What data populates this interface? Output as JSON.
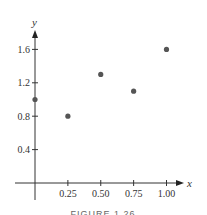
{
  "chart_data": {
    "type": "scatter",
    "title": "",
    "caption": "FIGURE 1.26",
    "xlabel": "x",
    "ylabel": "y",
    "xlim": [
      0,
      1.1
    ],
    "ylim": [
      0,
      1.8
    ],
    "grid": false,
    "x_ticks": [
      0.25,
      0.5,
      0.75,
      1.0
    ],
    "x_tick_labels": [
      "0.25",
      "0.50",
      "0.75",
      "1.00"
    ],
    "y_ticks": [
      0.4,
      0.8,
      1.2,
      1.6
    ],
    "y_tick_labels": [
      "0.4",
      "0.8",
      "1.2",
      "1.6"
    ],
    "points": [
      {
        "x": 0.0,
        "y": 1.0
      },
      {
        "x": 0.25,
        "y": 0.8
      },
      {
        "x": 0.5,
        "y": 1.3
      },
      {
        "x": 0.75,
        "y": 1.1
      },
      {
        "x": 1.0,
        "y": 1.6
      }
    ],
    "point_color": "#555555"
  }
}
